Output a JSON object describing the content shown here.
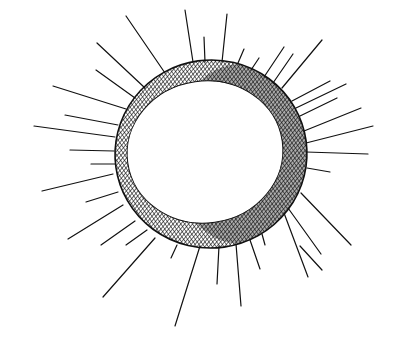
{
  "image": {
    "title": "Hand-drawn sun sketch",
    "description": "Ink drawing of a cross-hatched ring with radiating straight lines",
    "width": 401,
    "height": 348,
    "background": "#ffffff",
    "ink_color": "#111111"
  },
  "ring": {
    "outer": {
      "cx": 211,
      "cy": 154,
      "rx": 96,
      "ry": 94,
      "rotate": -8
    },
    "inner": {
      "cx": 205,
      "cy": 152,
      "rx": 78,
      "ry": 71,
      "rotate": -8
    },
    "hatch_spacing": 3
  },
  "rays": [
    [
      185,
      10,
      193,
      62
    ],
    [
      204,
      37,
      205,
      62
    ],
    [
      227,
      14,
      222,
      62
    ],
    [
      126,
      16,
      165,
      73
    ],
    [
      97,
      43,
      145,
      88
    ],
    [
      96,
      70,
      135,
      98
    ],
    [
      53,
      86,
      126,
      109
    ],
    [
      65,
      115,
      118,
      125
    ],
    [
      34,
      126,
      115,
      137
    ],
    [
      70,
      150,
      114,
      151
    ],
    [
      91,
      164,
      115,
      164
    ],
    [
      42,
      191,
      113,
      174
    ],
    [
      86,
      202,
      118,
      192
    ],
    [
      68,
      239,
      123,
      205
    ],
    [
      101,
      245,
      135,
      221
    ],
    [
      126,
      245,
      147,
      230
    ],
    [
      103,
      297,
      155,
      238
    ],
    [
      171,
      258,
      177,
      245
    ],
    [
      175,
      326,
      200,
      246
    ],
    [
      217,
      284,
      219,
      246
    ],
    [
      241,
      306,
      236,
      244
    ],
    [
      260,
      269,
      250,
      240
    ],
    [
      265,
      245,
      262,
      234
    ],
    [
      322,
      270,
      300,
      246
    ],
    [
      308,
      277,
      284,
      213
    ],
    [
      321,
      254,
      288,
      208
    ],
    [
      351,
      245,
      301,
      193
    ],
    [
      330,
      172,
      307,
      168
    ],
    [
      368,
      154,
      306,
      152
    ],
    [
      373,
      126,
      306,
      143
    ],
    [
      361,
      108,
      304,
      131
    ],
    [
      337,
      98,
      300,
      116
    ],
    [
      346,
      84,
      296,
      108
    ],
    [
      330,
      81,
      292,
      101
    ],
    [
      322,
      40,
      282,
      88
    ],
    [
      293,
      54,
      273,
      83
    ],
    [
      284,
      47,
      264,
      77
    ],
    [
      259,
      58,
      251,
      70
    ],
    [
      244,
      49,
      238,
      63
    ]
  ]
}
